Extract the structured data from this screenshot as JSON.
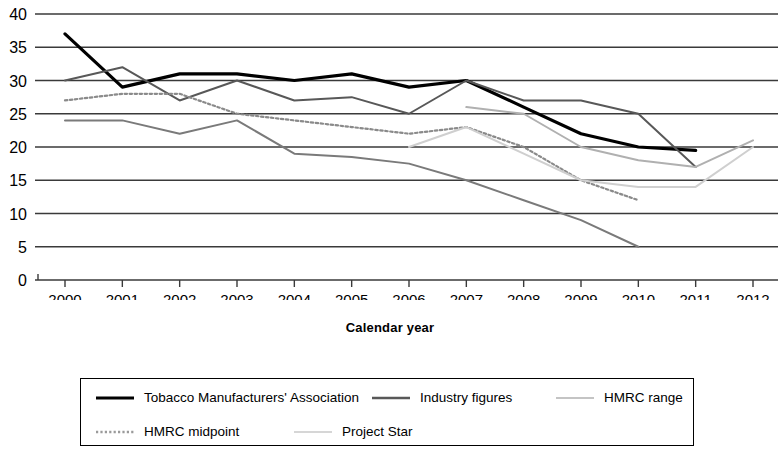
{
  "chart_data": {
    "type": "line",
    "title": "",
    "xlabel": "Calendar year",
    "ylabel": "",
    "x": [
      2000,
      2001,
      2002,
      2003,
      2004,
      2005,
      2006,
      2007,
      2008,
      2009,
      2010,
      2011,
      2012
    ],
    "xticklabels": [
      "2000",
      "2001",
      "2002",
      "2003",
      "2004",
      "2005",
      "2006",
      "2007",
      "2008",
      "2009",
      "2010",
      "2011",
      "2012"
    ],
    "yticklabels": [
      "0",
      "5",
      "10",
      "15",
      "20",
      "25",
      "30",
      "35",
      "40"
    ],
    "ylim": [
      0,
      40
    ],
    "ytick_step": 5,
    "grid": "horizontal",
    "legend_position": "bottom",
    "series": [
      {
        "name": "Tobacco Manufacturers' Association",
        "color": "#000000",
        "style": "solid",
        "width": 3.2,
        "x": [
          2000,
          2001,
          2002,
          2003,
          2004,
          2005,
          2006,
          2007,
          2008,
          2009,
          2010,
          2011
        ],
        "values": [
          37,
          29,
          31,
          31,
          30,
          31,
          29,
          30,
          26,
          22,
          20,
          19.5
        ]
      },
      {
        "name": "Industry figures",
        "color": "#585858",
        "style": "solid",
        "width": 2.0,
        "x": [
          2000,
          2001,
          2002,
          2003,
          2004,
          2005,
          2006,
          2007,
          2008,
          2009,
          2010,
          2011
        ],
        "values": [
          30,
          32,
          27,
          30,
          27,
          27.5,
          25,
          30,
          27,
          27,
          25,
          17
        ]
      },
      {
        "name": "HMRC range",
        "color": "#b0b0b0",
        "style": "solid",
        "width": 2.0,
        "x": [
          2007,
          2008,
          2009,
          2010,
          2011,
          2012
        ],
        "values": [
          26,
          25,
          20,
          18,
          17,
          21
        ]
      },
      {
        "name": "HMRC midpoint",
        "color": "#8a8a8a",
        "style": "dotted",
        "width": 2.2,
        "x": [
          2000,
          2001,
          2002,
          2003,
          2004,
          2005,
          2006,
          2007,
          2008,
          2009,
          2010
        ],
        "values": [
          27,
          28,
          28,
          25,
          24,
          23,
          22,
          23,
          20,
          15,
          12
        ]
      },
      {
        "name": "Project Star",
        "color": "#cfcfcf",
        "style": "solid",
        "width": 2.0,
        "x": [
          2006,
          2007,
          2008,
          2009,
          2010,
          2011,
          2012
        ],
        "values": [
          20,
          23,
          19,
          15,
          14,
          14,
          20
        ]
      },
      {
        "name": "lower-band",
        "color": "#7a7a7a",
        "style": "solid",
        "width": 2.0,
        "x": [
          2000,
          2001,
          2002,
          2003,
          2004,
          2005,
          2006,
          2007,
          2008,
          2009,
          2010
        ],
        "values": [
          24,
          24,
          22,
          24,
          19,
          18.5,
          17.5,
          15,
          12,
          9,
          5
        ]
      }
    ]
  },
  "axis": {
    "x_title": "Calendar year"
  },
  "legend": {
    "items": [
      {
        "label": "Tobacco Manufacturers' Association",
        "color": "#000000",
        "style": "solid",
        "width": 3.2
      },
      {
        "label": "Industry figures",
        "color": "#585858",
        "style": "solid",
        "width": 2.4
      },
      {
        "label": "HMRC range",
        "color": "#c4c4c4",
        "style": "solid",
        "width": 2.2
      },
      {
        "label": "HMRC midpoint",
        "color": "#9a9a9a",
        "style": "dotted",
        "width": 2.4
      },
      {
        "label": "Project Star",
        "color": "#d6d6d6",
        "style": "solid",
        "width": 2.2
      }
    ]
  }
}
